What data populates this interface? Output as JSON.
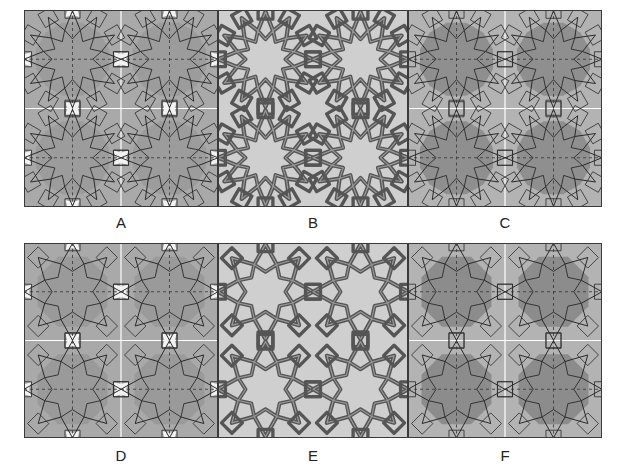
{
  "figure": {
    "panels": [
      {
        "id": "A",
        "label": "A",
        "style": "construction",
        "bg": "#a9a9a9",
        "cell_bg": "#9c9c9c",
        "highlight": "#f2f2f2",
        "line": "#2a2a2a",
        "band": false,
        "motif": "star12",
        "guides": true,
        "x": 24,
        "y": 10,
        "w": 194,
        "h": 197
      },
      {
        "id": "B",
        "label": "B",
        "style": "interlace",
        "bg": "#cfcfcf",
        "cell_bg": "#cfcfcf",
        "highlight": "#cfcfcf",
        "line": "#555555",
        "band": true,
        "motif": "star12",
        "guides": false,
        "x": 218,
        "y": 10,
        "w": 190,
        "h": 197
      },
      {
        "id": "C",
        "label": "C",
        "style": "construction-shaded",
        "bg": "#b3b3b3",
        "cell_bg": "#8f8f8f",
        "highlight": "#b9b9b9",
        "line": "#2a2a2a",
        "band": false,
        "motif": "star12",
        "guides": true,
        "x": 408,
        "y": 10,
        "w": 194,
        "h": 197
      },
      {
        "id": "D",
        "label": "D",
        "style": "construction",
        "bg": "#a9a9a9",
        "cell_bg": "#9a9a9a",
        "highlight": "#f2f2f2",
        "line": "#2a2a2a",
        "band": false,
        "motif": "star8",
        "guides": true,
        "x": 24,
        "y": 243,
        "w": 194,
        "h": 195
      },
      {
        "id": "E",
        "label": "E",
        "style": "interlace",
        "bg": "#cfcfcf",
        "cell_bg": "#cfcfcf",
        "highlight": "#cfcfcf",
        "line": "#555555",
        "band": true,
        "motif": "star8",
        "guides": false,
        "x": 218,
        "y": 243,
        "w": 190,
        "h": 195
      },
      {
        "id": "F",
        "label": "F",
        "style": "construction-shaded",
        "bg": "#b3b3b3",
        "cell_bg": "#8c8c8c",
        "highlight": "#b9b9b9",
        "line": "#2a2a2a",
        "band": false,
        "motif": "star8",
        "guides": true,
        "x": 408,
        "y": 243,
        "w": 194,
        "h": 195
      }
    ],
    "labels_y": {
      "top": 214,
      "bottom": 447
    },
    "grid": {
      "cols": 2,
      "rows": 2,
      "guide_color": "#333333",
      "gridline_color": "#ffffff"
    }
  }
}
